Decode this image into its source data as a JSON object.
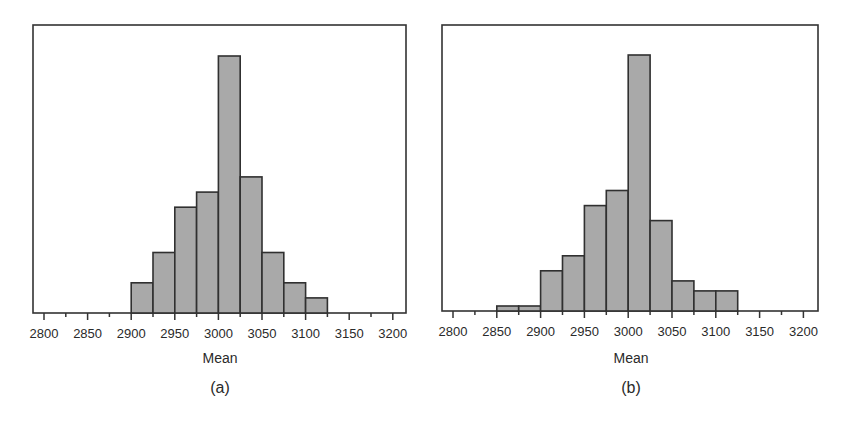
{
  "figure": {
    "colors": {
      "bar_fill": "#a9a9a9",
      "bar_edge": "#303030",
      "frame": "#333333",
      "text": "#2a2a2a"
    }
  },
  "chart_data": [
    {
      "type": "bar",
      "subtype": "histogram",
      "panel_label": "(a)",
      "title": "",
      "xlabel": "Mean",
      "ylabel": "",
      "xlim": [
        2785,
        3215
      ],
      "xticks": [
        2800,
        2850,
        2900,
        2950,
        3000,
        3050,
        3100,
        3150,
        3200
      ],
      "xtick_labels": [
        "2800",
        "2850",
        "2900",
        "2950",
        "3000",
        "3050",
        "3100",
        "3150",
        "3200"
      ],
      "minor_xticks": [
        2825,
        2875,
        2925,
        2975,
        3025,
        3075,
        3125,
        3175
      ],
      "bin_width": 25,
      "bin_starts": [
        2900,
        2925,
        2950,
        2975,
        3000,
        3025,
        3050,
        3075,
        3100
      ],
      "values": [
        2,
        4,
        7,
        8,
        17,
        9,
        4,
        2,
        1
      ],
      "value_note": "estimated relative frequencies (no y-axis shown)",
      "ymax": 19,
      "grid": false,
      "legend": null
    },
    {
      "type": "bar",
      "subtype": "histogram",
      "panel_label": "(b)",
      "title": "",
      "xlabel": "Mean",
      "ylabel": "",
      "xlim": [
        2785,
        3215
      ],
      "xticks": [
        2800,
        2850,
        2900,
        2950,
        3000,
        3050,
        3100,
        3150,
        3200
      ],
      "xtick_labels": [
        "2800",
        "2850",
        "2900",
        "2950",
        "3000",
        "3050",
        "3100",
        "3150",
        "3200"
      ],
      "minor_xticks": [
        2825,
        2875,
        2925,
        2975,
        3025,
        3075,
        3125,
        3175
      ],
      "bin_width": 25,
      "bin_starts": [
        2850,
        2875,
        2900,
        2925,
        2950,
        2975,
        3000,
        3025,
        3050,
        3075,
        3100
      ],
      "values": [
        1,
        1,
        8,
        11,
        21,
        24,
        51,
        18,
        6,
        4,
        4
      ],
      "value_note": "estimated relative frequencies (no y-axis shown)",
      "ymax": 57,
      "grid": false,
      "legend": null
    }
  ]
}
